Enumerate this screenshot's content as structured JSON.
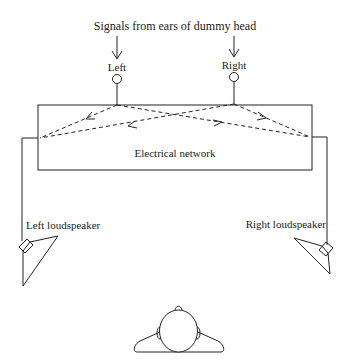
{
  "title": "Signals from ears of dummy head",
  "inputs": {
    "left": "Left",
    "right": "Right"
  },
  "network": {
    "label": "Electrical network"
  },
  "speakers": {
    "left": "Left loudspeaker",
    "right": "Right loudspeaker"
  },
  "listener": {
    "description": "listener-head-top-view"
  },
  "colors": {
    "line": "#222222",
    "background": "#ffffff"
  }
}
